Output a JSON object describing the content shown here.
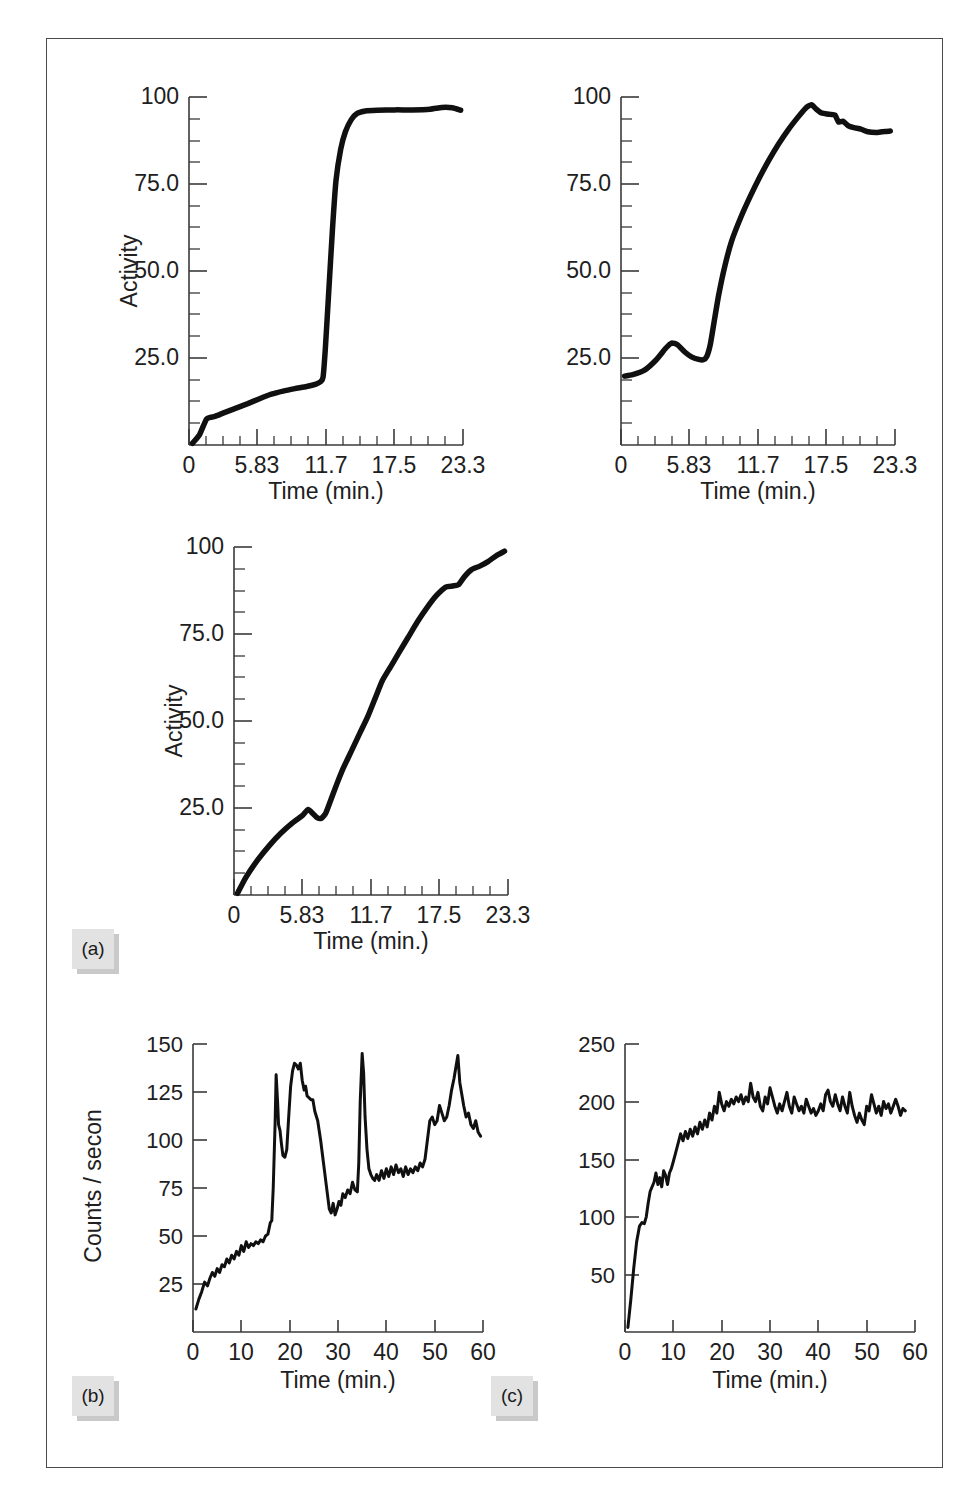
{
  "figure": {
    "frame_color": "#4a4a4a",
    "background": "#ffffff",
    "curve_color": "#101010",
    "chip_color": "#e2e2e2",
    "chip_shadow_color": "#c9c9c9"
  },
  "panels": [
    {
      "id": "a",
      "label": "(a)"
    },
    {
      "id": "b",
      "label": "(b)"
    },
    {
      "id": "c",
      "label": "(c)"
    }
  ],
  "chart_data": [
    {
      "id": "a1",
      "panel": "(a)",
      "position": "top-left",
      "type": "line",
      "title": "",
      "xlabel": "Time (min.)",
      "ylabel": "Activity",
      "xlim": [
        0,
        23.3
      ],
      "ylim": [
        0,
        100
      ],
      "xticks": [
        0,
        5.83,
        11.7,
        17.5,
        23.3
      ],
      "xtick_labels": [
        "0",
        "5.83",
        "11.7",
        "17.5",
        "23.3"
      ],
      "yticks": [
        25.0,
        50.0,
        75.0,
        100
      ],
      "ytick_labels": [
        "25.0",
        "50.0",
        "75.0",
        "100"
      ],
      "minor_ticks_per_major": 3,
      "grid": false,
      "legend": "none",
      "x": [
        0.3,
        0.9,
        1.5,
        2.2,
        3.0,
        4.0,
        5.0,
        6.0,
        7.0,
        8.0,
        9.0,
        10.0,
        10.8,
        11.2,
        11.4,
        11.6,
        11.9,
        12.2,
        12.5,
        12.9,
        13.3,
        13.8,
        14.3,
        15.0,
        16.0,
        17.5,
        19.0,
        20.5,
        21.5,
        22.4,
        23.1
      ],
      "y": [
        0.5,
        3.0,
        7.5,
        8.2,
        9.3,
        10.6,
        11.9,
        13.3,
        14.6,
        15.5,
        16.2,
        16.8,
        17.5,
        18.2,
        19.5,
        28.0,
        45.0,
        62.0,
        76.0,
        85.0,
        90.0,
        93.5,
        95.3,
        96.0,
        96.2,
        96.3,
        96.3,
        96.5,
        97.0,
        96.9,
        96.2
      ]
    },
    {
      "id": "a2",
      "panel": "(a)",
      "position": "top-right",
      "type": "line",
      "title": "",
      "xlabel": "Time (min.)",
      "ylabel": "",
      "xlim": [
        0,
        23.3
      ],
      "ylim": [
        0,
        100
      ],
      "xticks": [
        0,
        5.83,
        11.7,
        17.5,
        23.3
      ],
      "xtick_labels": [
        "0",
        "5.83",
        "11.7",
        "17.5",
        "23.3"
      ],
      "yticks": [
        25.0,
        50.0,
        75.0,
        100
      ],
      "ytick_labels": [
        "25.0",
        "50.0",
        "75.0",
        "100"
      ],
      "minor_ticks_per_major": 3,
      "grid": false,
      "legend": "none",
      "x": [
        0.3,
        1.0,
        2.0,
        3.0,
        3.8,
        4.3,
        4.8,
        5.4,
        6.0,
        6.6,
        7.0,
        7.3,
        7.6,
        7.9,
        8.3,
        8.8,
        9.4,
        10.2,
        11.0,
        11.8,
        12.6,
        13.4,
        14.2,
        15.0,
        15.7,
        16.2,
        16.6,
        17.0,
        17.4,
        17.8,
        18.2,
        18.5,
        18.9,
        19.3,
        19.8,
        20.4,
        21.0,
        21.8,
        22.4,
        22.9
      ],
      "y": [
        19.8,
        20.2,
        21.5,
        24.5,
        27.8,
        29.3,
        28.8,
        26.8,
        25.3,
        24.6,
        24.5,
        25.5,
        29.0,
        35.0,
        43.0,
        51.0,
        58.5,
        65.5,
        71.5,
        77.0,
        82.0,
        86.5,
        90.5,
        94.0,
        96.8,
        97.8,
        96.5,
        95.5,
        95.2,
        95.0,
        94.8,
        92.8,
        93.0,
        91.8,
        91.2,
        90.8,
        90.0,
        89.8,
        90.1,
        90.2
      ]
    },
    {
      "id": "a3",
      "panel": "(a)",
      "position": "middle-left",
      "type": "line",
      "title": "",
      "xlabel": "Time (min.)",
      "ylabel": "Activity",
      "xlim": [
        0,
        23.3
      ],
      "ylim": [
        0,
        100
      ],
      "xticks": [
        0,
        5.83,
        11.7,
        17.5,
        23.3
      ],
      "xtick_labels": [
        "0",
        "5.83",
        "11.7",
        "17.5",
        "23.3"
      ],
      "yticks": [
        25.0,
        50.0,
        75.0,
        100
      ],
      "ytick_labels": [
        "25.0",
        "50.0",
        "75.0",
        "100"
      ],
      "minor_ticks_per_major": 3,
      "grid": false,
      "legend": "none",
      "x": [
        0.3,
        1.0,
        2.0,
        3.0,
        4.0,
        5.0,
        5.8,
        6.3,
        6.7,
        7.0,
        7.4,
        7.8,
        8.2,
        8.7,
        9.3,
        10.0,
        10.7,
        11.4,
        12.0,
        12.6,
        13.3,
        14.0,
        14.8,
        15.6,
        16.4,
        17.2,
        18.0,
        18.6,
        19.1,
        19.6,
        20.2,
        20.9,
        21.6,
        22.3,
        23.0
      ],
      "y": [
        0.5,
        5.0,
        10.0,
        14.2,
        17.8,
        20.8,
        22.8,
        24.6,
        23.4,
        22.4,
        22.0,
        23.5,
        27.0,
        31.5,
        36.5,
        41.5,
        46.5,
        51.5,
        56.5,
        61.5,
        65.5,
        69.5,
        74.0,
        78.5,
        82.5,
        86.0,
        88.5,
        88.8,
        89.2,
        91.5,
        93.5,
        94.5,
        95.8,
        97.5,
        98.8
      ]
    },
    {
      "id": "b",
      "panel": "(b)",
      "position": "bottom-left",
      "type": "line",
      "title": "",
      "xlabel": "Time (min.)",
      "ylabel": "Counts / secon",
      "xlim": [
        0,
        60
      ],
      "ylim": [
        0,
        150
      ],
      "xticks": [
        0,
        10,
        20,
        30,
        40,
        50,
        60
      ],
      "xtick_labels": [
        "0",
        "10",
        "20",
        "30",
        "40",
        "50",
        "60"
      ],
      "yticks": [
        25,
        50,
        75,
        100,
        125,
        150
      ],
      "ytick_labels": [
        "25",
        "50",
        "75",
        "100",
        "125",
        "150"
      ],
      "minor_ticks_per_major": 0,
      "grid": false,
      "legend": "none",
      "x": [
        0.6,
        1.2,
        1.8,
        2.4,
        3.0,
        3.5,
        4.0,
        4.5,
        5.0,
        5.5,
        6.0,
        6.5,
        7.0,
        7.5,
        8.0,
        8.5,
        9.0,
        9.5,
        10.0,
        10.5,
        11.0,
        11.5,
        12.0,
        12.5,
        13.0,
        13.5,
        14.0,
        14.5,
        15.0,
        15.5,
        16.0,
        16.3,
        16.6,
        17.0,
        17.2,
        17.5,
        17.7,
        18.0,
        18.3,
        18.6,
        19.0,
        19.4,
        19.8,
        20.2,
        20.6,
        21.0,
        21.4,
        21.8,
        22.2,
        22.6,
        23.0,
        23.3,
        23.6,
        24.0,
        24.4,
        24.8,
        25.2,
        25.8,
        26.4,
        27.0,
        27.6,
        28.2,
        28.6,
        29.0,
        29.4,
        29.8,
        30.2,
        30.6,
        31.0,
        31.5,
        32.0,
        32.5,
        33.0,
        33.5,
        34.0,
        34.3,
        34.6,
        35.0,
        35.3,
        35.6,
        36.0,
        36.4,
        36.8,
        37.2,
        37.6,
        38.0,
        38.5,
        39.0,
        39.5,
        40.0,
        40.5,
        41.0,
        41.5,
        42.0,
        42.5,
        43.0,
        43.5,
        44.0,
        44.5,
        45.0,
        45.5,
        46.0,
        46.5,
        47.0,
        47.5,
        48.0,
        48.5,
        49.0,
        49.5,
        50.0,
        50.5,
        51.0,
        51.5,
        52.0,
        52.5,
        53.0,
        53.5,
        54.0,
        54.4,
        54.8,
        55.2,
        55.6,
        56.0,
        56.5,
        57.0,
        57.5,
        58.0,
        58.5,
        59.0,
        59.5
      ],
      "y": [
        12,
        17,
        21,
        26,
        24,
        28,
        31,
        29,
        33,
        31,
        35,
        34,
        38,
        36,
        40,
        38,
        42,
        40,
        45,
        42,
        47,
        44,
        46,
        45,
        47,
        46,
        48,
        47,
        50,
        51,
        57,
        58,
        75,
        110,
        134,
        120,
        108,
        105,
        98,
        92,
        91,
        95,
        112,
        128,
        136,
        140,
        139,
        137,
        140,
        131,
        126,
        128,
        123,
        122,
        121,
        121,
        115,
        110,
        100,
        88,
        76,
        64,
        62,
        67,
        61,
        64,
        68,
        66,
        72,
        70,
        74,
        72,
        78,
        74,
        73,
        88,
        120,
        145,
        135,
        112,
        95,
        85,
        82,
        80,
        79,
        82,
        79,
        84,
        80,
        85,
        81,
        86,
        82,
        87,
        83,
        85,
        81,
        86,
        82,
        85,
        83,
        86,
        84,
        88,
        86,
        90,
        100,
        110,
        112,
        108,
        110,
        118,
        114,
        110,
        112,
        118,
        126,
        132,
        138,
        144,
        130,
        124,
        118,
        112,
        114,
        108,
        106,
        110,
        104,
        102,
        100
      ]
    },
    {
      "id": "c",
      "panel": "(c)",
      "position": "bottom-right",
      "type": "line",
      "title": "",
      "xlabel": "Time (min.)",
      "ylabel": "",
      "xlim": [
        0,
        60
      ],
      "ylim": [
        0,
        250
      ],
      "xticks": [
        0,
        10,
        20,
        30,
        40,
        50,
        60
      ],
      "xtick_labels": [
        "0",
        "10",
        "20",
        "30",
        "40",
        "50",
        "60"
      ],
      "yticks": [
        50,
        100,
        150,
        200,
        250
      ],
      "ytick_labels": [
        "50",
        "100",
        "150",
        "200",
        "250"
      ],
      "minor_ticks_per_major": 0,
      "grid": false,
      "legend": "none",
      "x": [
        0.6,
        1.2,
        1.8,
        2.4,
        3.0,
        3.5,
        4.0,
        4.4,
        4.8,
        5.2,
        5.6,
        6.0,
        6.4,
        6.8,
        7.2,
        7.6,
        8.0,
        8.4,
        8.8,
        9.2,
        9.6,
        10.0,
        10.5,
        11.0,
        11.5,
        12.0,
        12.5,
        13.0,
        13.5,
        14.0,
        14.5,
        15.0,
        15.5,
        16.0,
        16.5,
        17.0,
        17.5,
        18.0,
        18.5,
        19.0,
        19.5,
        20.0,
        20.5,
        21.0,
        21.5,
        22.0,
        22.5,
        23.0,
        23.5,
        24.0,
        24.5,
        25.0,
        25.5,
        26.0,
        26.5,
        27.0,
        27.5,
        28.0,
        28.5,
        29.0,
        29.5,
        30.0,
        30.5,
        31.0,
        31.5,
        32.0,
        32.5,
        33.0,
        33.5,
        34.0,
        34.5,
        35.0,
        35.5,
        36.0,
        36.5,
        37.0,
        37.5,
        38.0,
        38.5,
        39.0,
        39.5,
        40.0,
        40.5,
        41.0,
        41.5,
        42.0,
        42.5,
        43.0,
        43.5,
        44.0,
        44.5,
        45.0,
        45.5,
        46.0,
        46.5,
        47.0,
        47.5,
        48.0,
        48.5,
        49.0,
        49.5,
        50.0,
        50.5,
        51.0,
        51.5,
        52.0,
        52.5,
        53.0,
        53.5,
        54.0,
        54.5,
        55.0,
        55.5,
        56.0,
        56.5,
        57.0,
        57.5,
        58.0
      ],
      "y": [
        4,
        28,
        55,
        78,
        92,
        95,
        94,
        100,
        112,
        122,
        126,
        130,
        138,
        128,
        134,
        126,
        140,
        136,
        128,
        138,
        142,
        148,
        156,
        164,
        172,
        166,
        174,
        168,
        176,
        170,
        178,
        172,
        182,
        176,
        184,
        178,
        190,
        184,
        196,
        190,
        208,
        198,
        192,
        200,
        196,
        202,
        198,
        204,
        200,
        206,
        198,
        204,
        200,
        216,
        204,
        200,
        208,
        196,
        192,
        204,
        198,
        212,
        204,
        196,
        190,
        198,
        192,
        200,
        208,
        196,
        190,
        204,
        198,
        192,
        196,
        190,
        202,
        196,
        190,
        194,
        188,
        192,
        198,
        192,
        206,
        210,
        200,
        196,
        206,
        198,
        192,
        204,
        196,
        190,
        208,
        196,
        188,
        182,
        190,
        184,
        180,
        196,
        192,
        206,
        198,
        190,
        196,
        188,
        200,
        194,
        198,
        190,
        196,
        202,
        196,
        188,
        194,
        192
      ]
    }
  ]
}
